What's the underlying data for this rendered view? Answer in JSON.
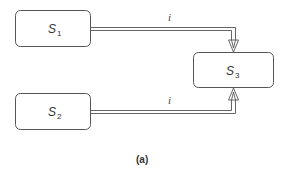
{
  "diagram": {
    "nodes": [
      {
        "id": "S1",
        "label": "S",
        "subscript": "1"
      },
      {
        "id": "S2",
        "label": "S",
        "subscript": "2"
      },
      {
        "id": "S3",
        "label": "S",
        "subscript": "3"
      }
    ],
    "edges": [
      {
        "from": "S1",
        "to": "S3",
        "label": "i",
        "style": "double-line-open-arrow"
      },
      {
        "from": "S2",
        "to": "S3",
        "label": "i",
        "style": "double-line-open-arrow"
      }
    ],
    "caption": "(a)"
  },
  "colors": {
    "stroke": "#555555",
    "background": "#ffffff"
  }
}
